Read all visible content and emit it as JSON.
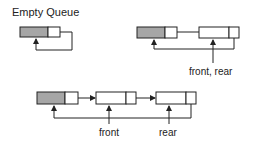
{
  "diagram": {
    "title": "Empty Queue",
    "labels": {
      "front_rear": "front, rear",
      "front": "front",
      "rear": "rear"
    },
    "colors": {
      "header_fill": "#a6a6a6",
      "node_fill": "#ffffff",
      "stroke": "#222222"
    },
    "panels": [
      {
        "name": "empty-queue",
        "nodes": [
          "header"
        ]
      },
      {
        "name": "one-element-queue",
        "nodes": [
          "header",
          "node"
        ]
      },
      {
        "name": "two-element-queue",
        "nodes": [
          "header",
          "node",
          "node"
        ]
      }
    ]
  }
}
